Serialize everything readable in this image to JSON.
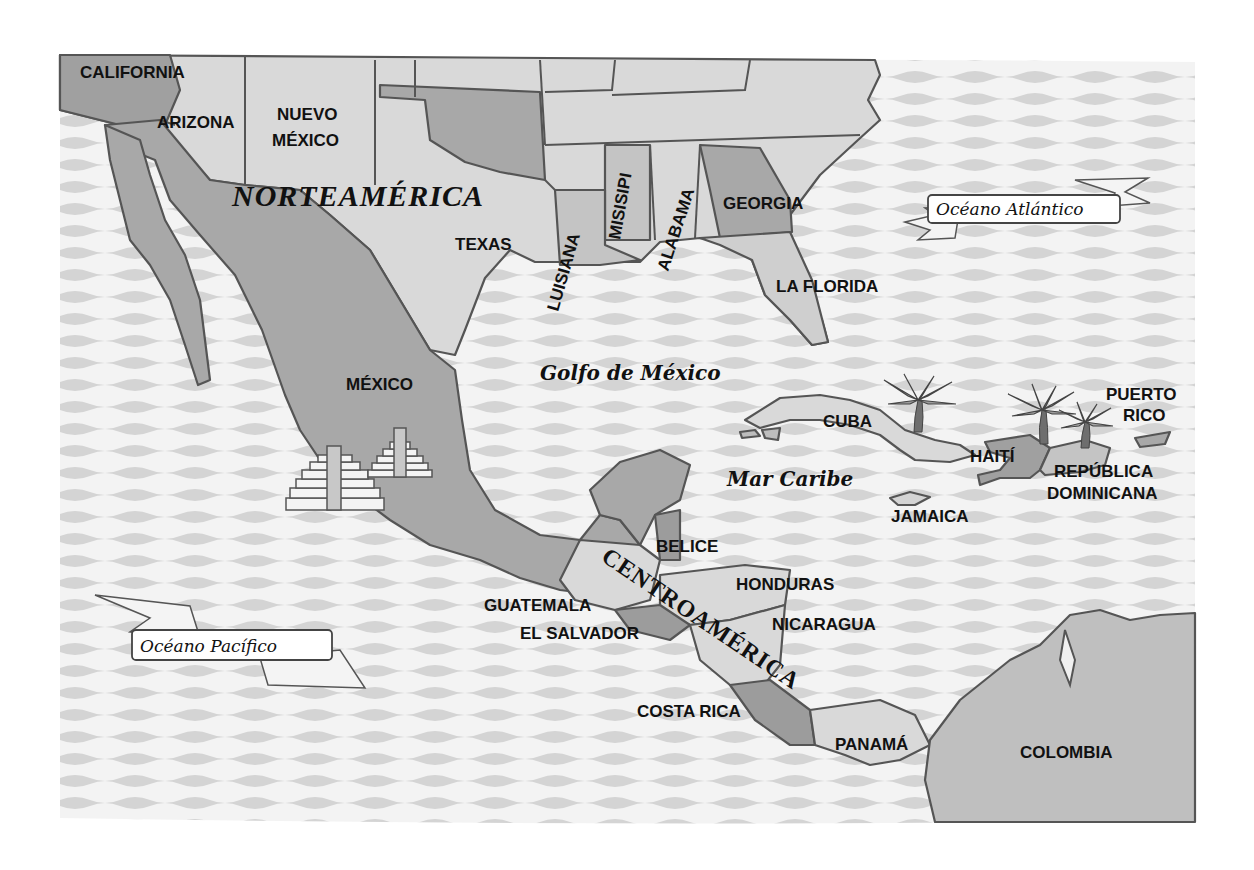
{
  "map": {
    "title_regions": {
      "north": "NORTEAMÉRICA",
      "central": "CENTROAMÉRICA"
    },
    "water_bodies": [
      {
        "id": "golfo",
        "label": "Golfo de México"
      },
      {
        "id": "caribe",
        "label": "Mar Caribe"
      },
      {
        "id": "atlantico",
        "label": "Océano Atlántico"
      },
      {
        "id": "pacifico",
        "label": "Océano Pacífico"
      }
    ],
    "us_states": [
      {
        "id": "california",
        "label": "CALIFORNIA"
      },
      {
        "id": "arizona",
        "label": "ARIZONA"
      },
      {
        "id": "nuevo_mexico_1",
        "label": "NUEVO"
      },
      {
        "id": "nuevo_mexico_2",
        "label": "MÉXICO"
      },
      {
        "id": "texas",
        "label": "TEXAS"
      },
      {
        "id": "luisiana",
        "label": "LUISIANA"
      },
      {
        "id": "misisipi",
        "label": "MISISIPI"
      },
      {
        "id": "alabama",
        "label": "ALABAMA"
      },
      {
        "id": "georgia",
        "label": "GEORGIA"
      },
      {
        "id": "florida",
        "label": "LA FLORIDA"
      }
    ],
    "countries": [
      {
        "id": "mexico",
        "label": "MÉXICO"
      },
      {
        "id": "belice",
        "label": "BELICE"
      },
      {
        "id": "guatemala",
        "label": "GUATEMALA"
      },
      {
        "id": "el_salvador",
        "label": "EL SALVADOR"
      },
      {
        "id": "honduras",
        "label": "HONDURAS"
      },
      {
        "id": "nicaragua",
        "label": "NICARAGUA"
      },
      {
        "id": "costa_rica",
        "label": "COSTA RICA"
      },
      {
        "id": "panama",
        "label": "PANAMÁ"
      },
      {
        "id": "colombia",
        "label": "COLOMBIA"
      }
    ],
    "islands": [
      {
        "id": "cuba",
        "label": "CUBA"
      },
      {
        "id": "jamaica",
        "label": "JAMAICA"
      },
      {
        "id": "haiti",
        "label": "HAITÍ"
      },
      {
        "id": "rep_dom_1",
        "label": "REPÚBLICA"
      },
      {
        "id": "rep_dom_2",
        "label": "DOMINICANA"
      },
      {
        "id": "puerto_rico_1",
        "label": "PUERTO"
      },
      {
        "id": "puerto_rico_2",
        "label": "RICO"
      }
    ],
    "decorations": [
      "pyramid-icon",
      "pyramid-icon",
      "palm-tree-icon",
      "palm-tree-icon",
      "palm-tree-icon"
    ],
    "colors": {
      "ocean_light": "#f2f2f2",
      "ocean_wave": "#d6d6d6",
      "land_light": "#d9d9d9",
      "land_mid": "#c4c4c4",
      "land_dark": "#9c9c9c",
      "border": "#555555"
    }
  }
}
